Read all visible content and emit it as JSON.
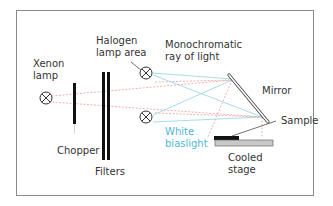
{
  "diagram": {
    "labels": {
      "xenon_lamp": "Xenon\nlamp",
      "halogen_lamp_area": "Halogen\nlamp area",
      "monochromatic_ray": "Monochromatic\nray of light",
      "mirror": "Mirror",
      "sample": "Sample",
      "white_biaslight": "White\nbiaslight",
      "cooled_stage": "Cooled\nstage",
      "chopper": "Chopper",
      "filters": "Filters"
    },
    "colors": {
      "monochromatic_ray": "#e8a0a0",
      "white_biaslight": "#8fd3e6",
      "white_biaslight_label": "#4fb7d6",
      "frame": "#8a8a8a",
      "stage": "#c8c8c8",
      "sample": "#111111"
    },
    "components": [
      "Xenon lamp",
      "Chopper",
      "Filters",
      "Halogen lamp (top)",
      "Halogen lamp (bottom)",
      "Mirror",
      "Sample",
      "Cooled stage"
    ]
  }
}
